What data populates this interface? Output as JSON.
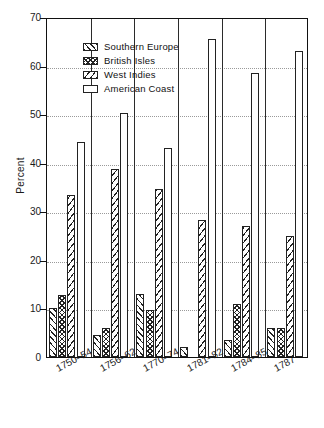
{
  "chart_data": {
    "type": "bar",
    "title": "",
    "xlabel": "",
    "ylabel": "Percent",
    "ylim": [
      0,
      70
    ],
    "ytick_step": 10,
    "yticks": [
      0,
      10,
      20,
      30,
      40,
      50,
      60,
      70
    ],
    "grid": true,
    "legend_position": "top-left-inside",
    "categories": [
      "1750–54",
      "1756–62",
      "1770–74",
      "1781–82",
      "1784–85",
      "1787"
    ],
    "series": [
      {
        "name": "Southern Europe",
        "pattern": "forward-diagonal-hatch",
        "values": [
          10.0,
          4.5,
          13.0,
          2.0,
          3.5,
          6.0
        ]
      },
      {
        "name": "British Isles",
        "pattern": "cross-hatch",
        "values": [
          12.8,
          6.0,
          9.7,
          0.0,
          11.0,
          6.0
        ]
      },
      {
        "name": "West Indies",
        "pattern": "backward-diagonal-hatch",
        "values": [
          33.3,
          38.8,
          34.5,
          28.3,
          27.0,
          25.0
        ]
      },
      {
        "name": "American Coast",
        "pattern": "empty",
        "values": [
          44.2,
          50.3,
          43.0,
          65.5,
          58.5,
          63.0
        ]
      }
    ]
  },
  "legend": {
    "items": [
      {
        "label": "Southern Europe"
      },
      {
        "label": "British Isles"
      },
      {
        "label": "West Indies"
      },
      {
        "label": "American Coast"
      }
    ]
  },
  "axes": {
    "y_title": "Percent"
  },
  "colors": {
    "ink": "#111111",
    "grid": "#9a9a9a",
    "background": "#ffffff"
  }
}
